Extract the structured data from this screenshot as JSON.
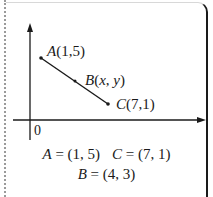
{
  "diagram": {
    "origin_label": "0",
    "points": [
      {
        "name": "A",
        "coords": "(1,5)",
        "label_var": "A",
        "label_args": "(1,5)"
      },
      {
        "name": "B",
        "coords": "(x, y)",
        "label_var": "B",
        "label_args_open": "(",
        "label_x": "x",
        "label_sep": ", ",
        "label_y": "y",
        "label_args_close": ")"
      },
      {
        "name": "C",
        "coords": "(7,1)",
        "label_var": "C",
        "label_args": "(7,1)"
      }
    ],
    "equations": {
      "line1_a_var": "A",
      "line1_a_val": " = (1, 5)",
      "line1_c_var": "C",
      "line1_c_val": " = (7, 1)",
      "line2_b_var": "B",
      "line2_b_val": " = (4, 3)"
    },
    "colors": {
      "ink": "#1a1a1a",
      "dotted_border": "#9a9a9a",
      "background": "#ffffff"
    }
  }
}
